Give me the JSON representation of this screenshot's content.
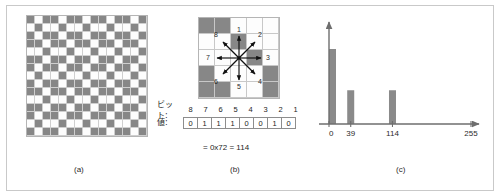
{
  "figure": {
    "background_color": "#ffffff",
    "frame_color": "#c9c9c9",
    "fill_color": "#878787",
    "empty_color": "#fdfdfd",
    "grid_line_color": "#c8c8c8"
  },
  "captions": {
    "a": "(a)",
    "b": "(b)",
    "c": "(c)"
  },
  "panel_a": {
    "cols": 15,
    "rows": 15,
    "cell_px": 8,
    "pattern": [
      [
        1,
        0,
        1,
        1,
        0,
        1,
        1,
        0,
        1,
        1,
        0,
        1,
        1,
        0,
        1
      ],
      [
        0,
        1,
        0,
        0,
        1,
        0,
        0,
        1,
        0,
        0,
        1,
        0,
        0,
        1,
        0
      ],
      [
        1,
        0,
        1,
        1,
        0,
        1,
        1,
        0,
        1,
        1,
        0,
        1,
        1,
        0,
        1
      ],
      [
        1,
        1,
        0,
        1,
        1,
        0,
        1,
        1,
        0,
        1,
        1,
        0,
        1,
        1,
        0
      ],
      [
        0,
        0,
        1,
        0,
        0,
        1,
        0,
        0,
        1,
        0,
        0,
        1,
        0,
        0,
        1
      ],
      [
        1,
        1,
        0,
        1,
        1,
        0,
        1,
        1,
        0,
        1,
        1,
        0,
        1,
        1,
        0
      ],
      [
        1,
        0,
        1,
        1,
        0,
        1,
        1,
        0,
        1,
        1,
        0,
        1,
        1,
        0,
        1
      ],
      [
        0,
        1,
        0,
        0,
        1,
        0,
        0,
        1,
        0,
        0,
        1,
        0,
        0,
        1,
        0
      ],
      [
        1,
        0,
        1,
        1,
        0,
        1,
        1,
        0,
        1,
        1,
        0,
        1,
        1,
        0,
        1
      ],
      [
        1,
        1,
        0,
        1,
        1,
        0,
        1,
        1,
        0,
        1,
        1,
        0,
        1,
        1,
        0
      ],
      [
        0,
        0,
        1,
        0,
        0,
        1,
        0,
        0,
        1,
        0,
        0,
        1,
        0,
        0,
        1
      ],
      [
        1,
        1,
        0,
        1,
        1,
        0,
        1,
        1,
        0,
        1,
        1,
        0,
        1,
        1,
        0
      ],
      [
        1,
        0,
        1,
        1,
        0,
        1,
        1,
        0,
        1,
        1,
        0,
        1,
        1,
        0,
        1
      ],
      [
        0,
        1,
        0,
        0,
        1,
        0,
        0,
        1,
        0,
        0,
        1,
        0,
        0,
        1,
        0
      ],
      [
        1,
        0,
        1,
        1,
        0,
        1,
        1,
        0,
        1,
        1,
        0,
        1,
        1,
        0,
        1
      ]
    ]
  },
  "panel_b": {
    "cols": 5,
    "rows": 5,
    "cell_px": 16,
    "pattern": [
      [
        1,
        1,
        0,
        0,
        0
      ],
      [
        0,
        0,
        1,
        0,
        0
      ],
      [
        0,
        0,
        0,
        1,
        0
      ],
      [
        1,
        0,
        0,
        0,
        1
      ],
      [
        1,
        1,
        0,
        0,
        1
      ]
    ],
    "direction_labels": [
      {
        "id": "1",
        "text": "1"
      },
      {
        "id": "2",
        "text": "2"
      },
      {
        "id": "3",
        "text": "3"
      },
      {
        "id": "4",
        "text": "4"
      },
      {
        "id": "5",
        "text": "5"
      },
      {
        "id": "6",
        "text": "6"
      },
      {
        "id": "7",
        "text": "7"
      },
      {
        "id": "8",
        "text": "8"
      }
    ]
  },
  "bit_table": {
    "bit_row_label": "ビット:",
    "value_row_label": "値:",
    "bits": [
      "8",
      "7",
      "6",
      "5",
      "4",
      "3",
      "2",
      "1"
    ],
    "values": [
      "0",
      "1",
      "1",
      "1",
      "0",
      "0",
      "1",
      "0"
    ],
    "formula": "= 0x72 = 114"
  },
  "chart_data": {
    "type": "bar",
    "title": "",
    "xlabel": "",
    "ylabel": "",
    "categories": [
      "0",
      "39",
      "114"
    ],
    "values": [
      100,
      45,
      45
    ],
    "tick_labels": [
      "0",
      "39",
      "114",
      "255"
    ],
    "tick_positions": [
      0,
      39,
      114,
      255
    ],
    "xlim": [
      0,
      255
    ],
    "ylim": [
      0,
      120
    ],
    "grid": false,
    "legend": "none",
    "bar_color": "#8a8a8a",
    "axis_color": "#6e6e6e"
  }
}
